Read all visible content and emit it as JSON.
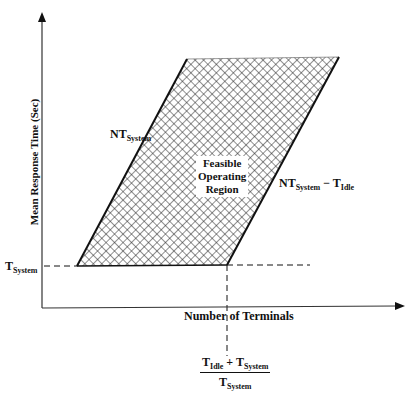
{
  "diagram": {
    "y_axis": {
      "label": "Mean Response Time (Sec)"
    },
    "x_axis": {
      "label": "Number of Terminals"
    },
    "region": {
      "label_lines": [
        "Feasible",
        "Operating",
        "Region"
      ]
    },
    "lines": {
      "left_edge": {
        "main": "NT",
        "sub": "System"
      },
      "right_edge": {
        "main": "NT",
        "sub": "System",
        "op": " − ",
        "main2": "T",
        "sub2": "Idle"
      }
    },
    "y_marker": {
      "main": "T",
      "sub": "System"
    },
    "x_marker": {
      "numerator": {
        "t1": "T",
        "s1": "Idle",
        "op": " + ",
        "t2": "T",
        "s2": "System"
      },
      "denominator": {
        "t": "T",
        "s": "System"
      }
    },
    "colors": {
      "ink": "#111111",
      "background": "#ffffff",
      "hatch": "#222222"
    }
  }
}
